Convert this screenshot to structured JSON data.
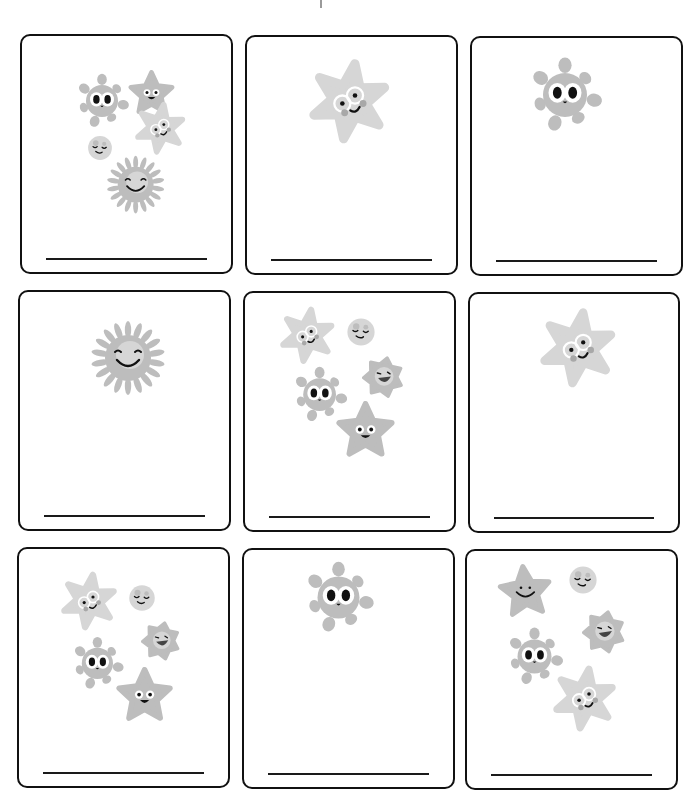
{
  "worksheet": {
    "type": "count-the-germs",
    "colors": {
      "border": "#111111",
      "line": "#1a1a1a",
      "char_fill": "#bdbdbd",
      "char_light": "#d6d6d6",
      "char_dark": "#a8a8a8",
      "face": "#111111"
    },
    "cards": [
      {
        "id": 1,
        "count": 5,
        "answer": "",
        "characters": [
          {
            "kind": "star5",
            "x": 107,
            "y": 34,
            "s": 0.75
          },
          {
            "kind": "blob",
            "x": 56,
            "y": 41,
            "s": 0.8
          },
          {
            "kind": "star6",
            "x": 113,
            "y": 67,
            "s": 0.72
          },
          {
            "kind": "ball",
            "x": 64,
            "y": 98,
            "s": 0.7
          },
          {
            "kind": "sun",
            "x": 84,
            "y": 119,
            "s": 0.78
          }
        ]
      },
      {
        "id": 2,
        "count": 1,
        "answer": "",
        "characters": [
          {
            "kind": "star6",
            "x": 62,
            "y": 24,
            "s": 1.15
          }
        ]
      },
      {
        "id": 3,
        "count": 1,
        "answer": "",
        "characters": [
          {
            "kind": "blob",
            "x": 60,
            "y": 24,
            "s": 1.1
          }
        ]
      },
      {
        "id": 4,
        "count": 1,
        "answer": "",
        "characters": [
          {
            "kind": "sun",
            "x": 70,
            "y": 28,
            "s": 1.0
          }
        ]
      },
      {
        "id": 5,
        "count": 5,
        "answer": "",
        "characters": [
          {
            "kind": "star6",
            "x": 35,
            "y": 15,
            "s": 0.78
          },
          {
            "kind": "ball",
            "x": 100,
            "y": 23,
            "s": 0.8
          },
          {
            "kind": "burst",
            "x": 117,
            "y": 63,
            "s": 0.85
          },
          {
            "kind": "blob",
            "x": 50,
            "y": 77,
            "s": 0.82
          },
          {
            "kind": "star5",
            "x": 92,
            "y": 108,
            "s": 0.95
          }
        ]
      },
      {
        "id": 6,
        "count": 1,
        "answer": "",
        "characters": [
          {
            "kind": "star6",
            "x": 70,
            "y": 16,
            "s": 1.08
          }
        ]
      },
      {
        "id": 7,
        "count": 5,
        "answer": "",
        "characters": [
          {
            "kind": "star6",
            "x": 42,
            "y": 24,
            "s": 0.8
          },
          {
            "kind": "ball",
            "x": 108,
            "y": 34,
            "s": 0.75
          },
          {
            "kind": "burst",
            "x": 122,
            "y": 72,
            "s": 0.8
          },
          {
            "kind": "blob",
            "x": 55,
            "y": 91,
            "s": 0.78
          },
          {
            "kind": "star5",
            "x": 98,
            "y": 118,
            "s": 0.92
          }
        ]
      },
      {
        "id": 8,
        "count": 1,
        "answer": "",
        "characters": [
          {
            "kind": "blob",
            "x": 63,
            "y": 16,
            "s": 1.05
          }
        ]
      },
      {
        "id": 9,
        "count": 5,
        "answer": "",
        "characters": [
          {
            "kind": "star5smile",
            "x": 32,
            "y": 13,
            "s": 0.88
          },
          {
            "kind": "ball",
            "x": 100,
            "y": 13,
            "s": 0.8
          },
          {
            "kind": "burst",
            "x": 115,
            "y": 59,
            "s": 0.88
          },
          {
            "kind": "blob",
            "x": 42,
            "y": 80,
            "s": 0.85
          },
          {
            "kind": "star6",
            "x": 86,
            "y": 116,
            "s": 0.9
          }
        ]
      }
    ]
  }
}
